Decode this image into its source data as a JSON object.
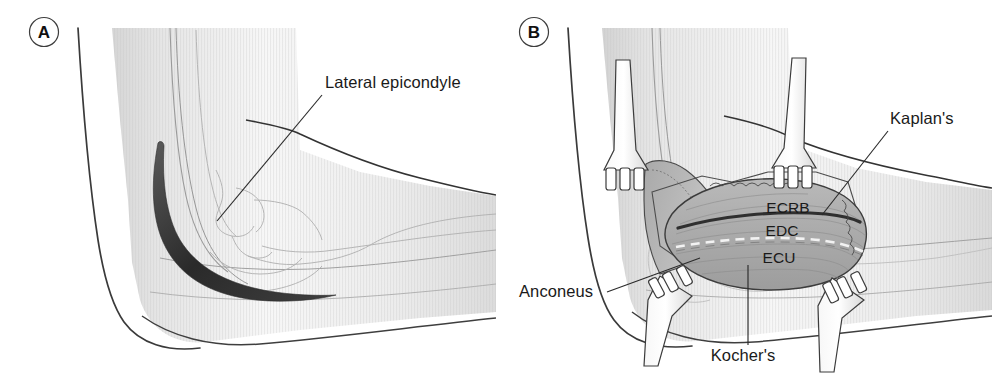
{
  "figure": {
    "background_color": "#ffffff",
    "ink_color": "#2b2b2b",
    "text_color": "#1a1a1a",
    "skin_fill": "#f2f2f2",
    "skin_shadow": "#cfcfcf",
    "muscle_fill": "#b4b4b4",
    "muscle_dark": "#8f8f8f",
    "incision_color": "#3a3a3a",
    "panels": [
      {
        "id": "A",
        "letter": "A",
        "name": "panel-a",
        "description": "Lateral view of flexed elbow showing skin incision and bony landmark",
        "labels": [
          {
            "name": "lateral-epicondyle",
            "text": "Lateral epicondyle",
            "x": 325,
            "y": 88,
            "anchor": "start",
            "leader": {
              "x1": 322,
              "y1": 95,
              "x2": 217,
              "y2": 221
            }
          }
        ],
        "annotations": {
          "incision": "curved lateral skin incision centred over the lateral epicondyle"
        }
      },
      {
        "id": "B",
        "letter": "B",
        "name": "panel-b",
        "description": "Deep exposure with four-prong retractors showing extensor muscle mass and intervals",
        "labels": [
          {
            "name": "kaplan-interval",
            "text": "Kaplan's",
            "x": 890,
            "y": 124,
            "anchor": "start",
            "leader": {
              "x1": 888,
              "y1": 131,
              "x2": 822,
              "y2": 215
            }
          },
          {
            "name": "ecrb-muscle",
            "text": "ECRB",
            "x": 788,
            "y": 213,
            "anchor": "middle",
            "leader": null
          },
          {
            "name": "edc-muscle",
            "text": "EDC",
            "x": 782,
            "y": 236,
            "anchor": "middle",
            "leader": null
          },
          {
            "name": "ecu-muscle",
            "text": "ECU",
            "x": 779,
            "y": 263,
            "anchor": "middle",
            "leader": null
          },
          {
            "name": "anconeus-muscle",
            "text": "Anconeus",
            "x": 519,
            "y": 297,
            "anchor": "start",
            "leader": {
              "x1": 607,
              "y1": 292,
              "x2": 700,
              "y2": 258
            }
          },
          {
            "name": "kocher-interval",
            "text": "Kocher's",
            "x": 743,
            "y": 361,
            "anchor": "middle",
            "leader": {
              "x1": 748,
              "y1": 345,
              "x2": 748,
              "y2": 265
            }
          }
        ],
        "retractors": [
          {
            "name": "retractor-proximal-anterior",
            "position": "upper-left"
          },
          {
            "name": "retractor-proximal-posterior",
            "position": "upper-right"
          },
          {
            "name": "retractor-distal-anterior",
            "position": "lower-left"
          },
          {
            "name": "retractor-distal-posterior",
            "position": "lower-right"
          }
        ],
        "intervals": [
          {
            "name": "kaplan-line",
            "style": "solid-dark",
            "between": "ECRB and EDC"
          },
          {
            "name": "kocher-line",
            "style": "dashed-light",
            "between": "ECU and anconeus"
          }
        ]
      }
    ]
  }
}
